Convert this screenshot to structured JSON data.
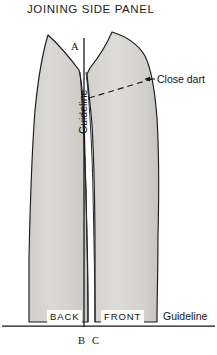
{
  "title": "JOINING SIDE PANEL",
  "points": {
    "a": "A",
    "b": "B",
    "c": "C"
  },
  "panels": {
    "back": "BACK",
    "front": "FRONT"
  },
  "annotations": {
    "close_dart": "Close dart",
    "guideline_vertical": "Guideline",
    "guideline_horizontal": "Guideline"
  },
  "colors": {
    "panel_fill": "#d9d7d3",
    "panel_stroke": "#1b1b1e",
    "line": "#141417",
    "text": "#17171a",
    "background": "#ffffff"
  }
}
